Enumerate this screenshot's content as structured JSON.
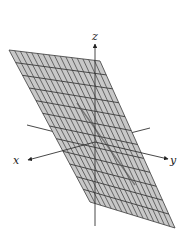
{
  "figure": {
    "type": "3d-plane-diagram",
    "axes": {
      "x": {
        "label": "x"
      },
      "y": {
        "label": "y"
      },
      "z": {
        "label": "z"
      }
    },
    "plane": {
      "corners": [
        [
          9,
          50
        ],
        [
          100,
          61
        ],
        [
          175,
          228
        ],
        [
          90,
          202
        ]
      ],
      "divisions_u": 16,
      "divisions_v": 12,
      "fill": "#c8c8c8",
      "grid_color": "#3a3a3a"
    },
    "origin": [
      95,
      142
    ],
    "vector": {
      "from": [
        77,
        103
      ],
      "to": [
        135,
        185
      ],
      "color": "#555555"
    },
    "colors": {
      "axis": "#333333",
      "background": "#ffffff"
    }
  }
}
